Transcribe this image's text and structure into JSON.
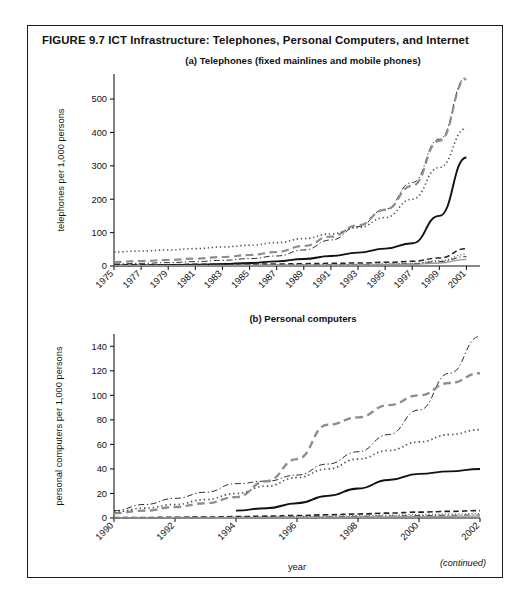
{
  "figure": {
    "number_label": "FIGURE 9.7",
    "title": "FIGURE 9.7  ICT Infrastructure: Telephones, Personal Computers, and Internet",
    "continued_note": "(continued)"
  },
  "panel_a": {
    "title": "(a) Telephones (fixed mainlines and mobile phones)",
    "ylabel": "telephones per 1,000 persons",
    "xlabel": "year"
  },
  "panel_b": {
    "title": "(b) Personal computers",
    "ylabel": "personal computers per 1,000 persons",
    "xlabel": "year"
  },
  "chart_data": [
    {
      "type": "line",
      "id": "panel-a",
      "title": "(a) Telephones (fixed mainlines and mobile phones)",
      "xlabel": "year",
      "ylabel": "telephones per 1,000 persons",
      "xlim": [
        1975,
        2002
      ],
      "ylim": [
        0,
        575
      ],
      "yticks": [
        0,
        100,
        200,
        300,
        400,
        500
      ],
      "xticks": [
        1975,
        1977,
        1979,
        1981,
        1983,
        1985,
        1987,
        1989,
        1991,
        1993,
        1995,
        1997,
        1999,
        2001
      ],
      "xtick_labels": [
        "1975",
        "1977",
        "1979",
        "1981",
        "1983",
        "1985",
        "1987",
        "1989",
        "1991",
        "1993",
        "1995",
        "1997",
        "1999",
        "2001"
      ],
      "grid": false,
      "legend": "none",
      "x": [
        1975,
        1977,
        1979,
        1981,
        1983,
        1985,
        1987,
        1989,
        1991,
        1993,
        1995,
        1997,
        1999,
        2001
      ],
      "series": [
        {
          "name": "series-1-dashdot",
          "style": "dashdot",
          "color": "#2b2b2b",
          "width": 1.0,
          "values": [
            6,
            8,
            10,
            13,
            17,
            22,
            30,
            48,
            78,
            118,
            170,
            250,
            380,
            565
          ]
        },
        {
          "name": "series-2-longdash",
          "style": "longdash",
          "color": "#8e8e8e",
          "width": 2.2,
          "values": [
            12,
            15,
            18,
            22,
            27,
            33,
            42,
            60,
            88,
            122,
            168,
            240,
            375,
            560
          ]
        },
        {
          "name": "series-3-dotted",
          "style": "dotted",
          "color": "#555555",
          "width": 1.6,
          "values": [
            42,
            45,
            48,
            52,
            57,
            62,
            70,
            82,
            96,
            115,
            145,
            200,
            295,
            412
          ]
        },
        {
          "name": "series-4-solid",
          "style": "solid",
          "color": "#111111",
          "width": 1.9,
          "values": [
            2,
            2,
            3,
            4,
            6,
            9,
            14,
            21,
            30,
            40,
            52,
            68,
            150,
            325
          ]
        },
        {
          "name": "series-5-dashed-low",
          "style": "dashed",
          "color": "#222222",
          "width": 1.5,
          "values": [
            4,
            4,
            4,
            5,
            5,
            6,
            6,
            7,
            8,
            9,
            11,
            14,
            24,
            52
          ]
        },
        {
          "name": "series-6-dotted-low",
          "style": "dotted",
          "color": "#666666",
          "width": 1.3,
          "values": [
            2,
            2,
            2,
            2,
            3,
            3,
            3,
            4,
            4,
            5,
            6,
            8,
            16,
            35
          ]
        },
        {
          "name": "series-7-dashdot-low",
          "style": "dashdot",
          "color": "#444444",
          "width": 1.1,
          "values": [
            1,
            1,
            1,
            2,
            2,
            2,
            3,
            3,
            4,
            4,
            5,
            7,
            13,
            28
          ]
        },
        {
          "name": "series-8-solid-low",
          "style": "solid",
          "color": "#9a9a9a",
          "width": 1.3,
          "values": [
            1,
            1,
            1,
            1,
            1,
            2,
            2,
            2,
            3,
            3,
            4,
            5,
            9,
            20
          ]
        }
      ]
    },
    {
      "type": "line",
      "id": "panel-b",
      "title": "(b) Personal computers",
      "xlabel": "year",
      "ylabel": "personal computers per 1,000 persons",
      "xlim": [
        1990,
        2002
      ],
      "ylim": [
        0,
        150
      ],
      "yticks": [
        0,
        20,
        40,
        60,
        80,
        100,
        120,
        140
      ],
      "xticks": [
        1990,
        1992,
        1994,
        1996,
        1998,
        2000,
        2002
      ],
      "xtick_labels": [
        "1990",
        "1992",
        "1994",
        "1996",
        "1998",
        "2000",
        "2002"
      ],
      "grid": false,
      "legend": "none",
      "x": [
        1990,
        1991,
        1992,
        1993,
        1994,
        1995,
        1996,
        1997,
        1998,
        1999,
        2000,
        2001,
        2002
      ],
      "series": [
        {
          "name": "series-1-dashdot",
          "style": "dashdot",
          "color": "#2b2b2b",
          "width": 1.0,
          "values": [
            6,
            11,
            16,
            21,
            28,
            30,
            35,
            44,
            54,
            68,
            88,
            118,
            148
          ]
        },
        {
          "name": "series-2-longdash",
          "style": "longdash",
          "color": "#8e8e8e",
          "width": 2.4,
          "values": [
            4,
            6,
            9,
            12,
            17,
            30,
            48,
            76,
            82,
            92,
            100,
            110,
            118
          ]
        },
        {
          "name": "series-3-dotted",
          "style": "dotted",
          "color": "#555555",
          "width": 1.7,
          "values": [
            5,
            8,
            11,
            15,
            20,
            26,
            33,
            40,
            48,
            55,
            62,
            68,
            72
          ]
        },
        {
          "name": "series-4-solid",
          "style": "solid",
          "color": "#111111",
          "width": 1.9,
          "values": [
            null,
            null,
            null,
            null,
            6,
            8,
            12,
            18,
            24,
            31,
            36,
            38,
            40
          ]
        },
        {
          "name": "series-5-dashed-low",
          "style": "dashed",
          "color": "#222222",
          "width": 1.6,
          "values": [
            0.3,
            0.4,
            0.6,
            0.8,
            1.1,
            1.5,
            2.0,
            2.6,
            3.3,
            4.0,
            4.8,
            5.4,
            6.0
          ]
        },
        {
          "name": "series-6-dotted-low",
          "style": "dotted",
          "color": "#666666",
          "width": 1.3,
          "values": [
            0.2,
            0.3,
            0.4,
            0.5,
            0.7,
            0.9,
            1.2,
            1.5,
            1.9,
            2.3,
            2.8,
            3.2,
            3.6
          ]
        },
        {
          "name": "series-7-dashdot-low",
          "style": "dashdot",
          "color": "#444444",
          "width": 1.1,
          "values": [
            0.1,
            0.2,
            0.25,
            0.35,
            0.5,
            0.6,
            0.8,
            1.0,
            1.3,
            1.6,
            1.9,
            2.2,
            2.5
          ]
        },
        {
          "name": "series-8-solid-low",
          "style": "solid",
          "color": "#9a9a9a",
          "width": 1.2,
          "values": [
            0.1,
            0.1,
            0.15,
            0.2,
            0.3,
            0.4,
            0.5,
            0.65,
            0.8,
            1.0,
            1.2,
            1.4,
            1.6
          ]
        }
      ]
    }
  ]
}
